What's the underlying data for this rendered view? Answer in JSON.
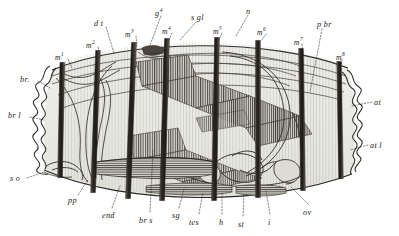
{
  "figure": {
    "kind": "scientific-engraving",
    "style": "monochrome line engraving with stipple and hatching",
    "width": 399,
    "height": 236,
    "background_color": "#ffffff",
    "ink_color": "#1c1a18",
    "body_fill": "#ebebe7",
    "bar_color": "#3a3632"
  },
  "labels": {
    "top": [
      {
        "id": "m1",
        "text": "m",
        "sup": "1",
        "x": 55,
        "y": 52,
        "lead": [
          [
            68,
            59
          ],
          [
            72,
            68
          ]
        ]
      },
      {
        "id": "m2",
        "text": "m",
        "sup": "2",
        "x": 86,
        "y": 40,
        "lead": [
          [
            98,
            47
          ],
          [
            100,
            57
          ]
        ]
      },
      {
        "id": "dt",
        "text": "d t",
        "sup": "",
        "x": 94,
        "y": 20,
        "lead": [
          [
            106,
            27
          ],
          [
            114,
            53
          ]
        ]
      },
      {
        "id": "m3",
        "text": "m",
        "sup": "3",
        "x": 125,
        "y": 29,
        "lead": [
          [
            136,
            36
          ],
          [
            137,
            46
          ]
        ]
      },
      {
        "id": "g4",
        "text": "g",
        "sup": "4",
        "x": 155,
        "y": 8,
        "lead": [
          [
            161,
            16
          ],
          [
            150,
            45
          ]
        ]
      },
      {
        "id": "m4",
        "text": "m",
        "sup": "4",
        "x": 162,
        "y": 26,
        "lead": [
          [
            172,
            33
          ],
          [
            168,
            42
          ]
        ]
      },
      {
        "id": "sgl",
        "text": "s gl",
        "sup": "",
        "x": 191,
        "y": 14,
        "lead": [
          [
            196,
            22
          ],
          [
            180,
            40
          ]
        ]
      },
      {
        "id": "m5",
        "text": "m",
        "sup": "5",
        "x": 213,
        "y": 26,
        "lead": [
          [
            222,
            33
          ],
          [
            219,
            40
          ]
        ]
      },
      {
        "id": "n",
        "text": "n",
        "sup": "",
        "x": 246,
        "y": 8,
        "lead": [
          [
            248,
            15
          ],
          [
            236,
            36
          ]
        ]
      },
      {
        "id": "m6",
        "text": "m",
        "sup": "6",
        "x": 257,
        "y": 27,
        "lead": [
          [
            266,
            34
          ],
          [
            262,
            40
          ]
        ]
      },
      {
        "id": "m7",
        "text": "m",
        "sup": "7",
        "x": 294,
        "y": 37,
        "lead": [
          [
            302,
            44
          ],
          [
            303,
            53
          ]
        ]
      },
      {
        "id": "pbr",
        "text": "p br",
        "sup": "",
        "x": 317,
        "y": 21,
        "lead": [
          [
            322,
            29
          ],
          [
            310,
            92
          ]
        ]
      },
      {
        "id": "m8",
        "text": "m",
        "sup": "8",
        "x": 336,
        "y": 52,
        "lead": [
          [
            342,
            59
          ],
          [
            341,
            66
          ]
        ]
      }
    ],
    "left": [
      {
        "id": "br",
        "text": "br.",
        "sup": "",
        "x": 20,
        "y": 76,
        "lead": [
          [
            38,
            81
          ],
          [
            50,
            88
          ]
        ]
      },
      {
        "id": "brl",
        "text": "br l",
        "sup": "",
        "x": 8,
        "y": 112,
        "lead": [
          [
            30,
            117
          ],
          [
            44,
            120
          ]
        ]
      },
      {
        "id": "so",
        "text": "s o",
        "sup": "",
        "x": 10,
        "y": 175,
        "lead": [
          [
            27,
            178
          ],
          [
            44,
            172
          ]
        ]
      }
    ],
    "right": [
      {
        "id": "at",
        "text": "at",
        "sup": "",
        "x": 374,
        "y": 99,
        "lead": [
          [
            372,
            102
          ],
          [
            352,
            106
          ]
        ]
      },
      {
        "id": "atl",
        "text": "at l",
        "sup": "",
        "x": 370,
        "y": 142,
        "lead": [
          [
            368,
            145
          ],
          [
            350,
            150
          ]
        ]
      }
    ],
    "bottom": [
      {
        "id": "pp",
        "text": "pp",
        "sup": "",
        "x": 68,
        "y": 197,
        "lead": [
          [
            78,
            195
          ],
          [
            88,
            180
          ]
        ]
      },
      {
        "id": "end",
        "text": "end",
        "sup": "",
        "x": 102,
        "y": 212,
        "lead": [
          [
            112,
            208
          ],
          [
            120,
            186
          ]
        ]
      },
      {
        "id": "brs",
        "text": "br s",
        "sup": "",
        "x": 139,
        "y": 217,
        "lead": [
          [
            150,
            212
          ],
          [
            153,
            150
          ]
        ]
      },
      {
        "id": "sg",
        "text": "sg",
        "sup": "",
        "x": 172,
        "y": 212,
        "lead": [
          [
            179,
            208
          ],
          [
            184,
            189
          ]
        ]
      },
      {
        "id": "tes",
        "text": "tes",
        "sup": "",
        "x": 189,
        "y": 219,
        "lead": [
          [
            199,
            214
          ],
          [
            203,
            192
          ]
        ]
      },
      {
        "id": "h",
        "text": "h",
        "sup": "",
        "x": 219,
        "y": 219,
        "lead": [
          [
            222,
            214
          ],
          [
            222,
            192
          ]
        ]
      },
      {
        "id": "st",
        "text": "st",
        "sup": "",
        "x": 238,
        "y": 221,
        "lead": [
          [
            243,
            216
          ],
          [
            244,
            194
          ]
        ]
      },
      {
        "id": "i",
        "text": "i",
        "sup": "",
        "x": 268,
        "y": 219,
        "lead": [
          [
            270,
            214
          ],
          [
            266,
            191
          ]
        ]
      },
      {
        "id": "ov",
        "text": "ov",
        "sup": "",
        "x": 303,
        "y": 209,
        "lead": [
          [
            308,
            204
          ],
          [
            290,
            186
          ]
        ]
      }
    ]
  },
  "muscle_bars": [
    {
      "id": "m1",
      "top_x": 62,
      "top_y": 63,
      "bot_x": 60,
      "bot_y": 177,
      "w": 4.6
    },
    {
      "id": "m2",
      "top_x": 98,
      "top_y": 51,
      "bot_x": 93,
      "bot_y": 192,
      "w": 4.6
    },
    {
      "id": "m3",
      "top_x": 134,
      "top_y": 43,
      "bot_x": 128,
      "bot_y": 198,
      "w": 4.8
    },
    {
      "id": "m4",
      "top_x": 167,
      "top_y": 39,
      "bot_x": 162,
      "bot_y": 200,
      "w": 4.8
    },
    {
      "id": "m5",
      "top_x": 217,
      "top_y": 38,
      "bot_x": 214,
      "bot_y": 200,
      "w": 4.8
    },
    {
      "id": "m6",
      "top_x": 258,
      "top_y": 41,
      "bot_x": 258,
      "bot_y": 197,
      "w": 4.8
    },
    {
      "id": "m7",
      "top_x": 301,
      "top_y": 49,
      "bot_x": 303,
      "bot_y": 190,
      "w": 4.6
    },
    {
      "id": "m8",
      "top_x": 339,
      "top_y": 62,
      "bot_x": 341,
      "bot_y": 178,
      "w": 4.4
    }
  ]
}
